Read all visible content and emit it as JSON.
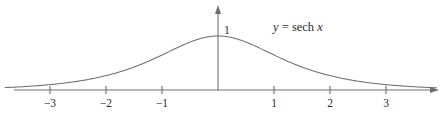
{
  "figure": {
    "background_color": "#ffffff",
    "line_color": "#6e6e6e",
    "text_color": "#2b2b2b"
  },
  "equation": {
    "lhs": "y",
    "operator": "=",
    "function_name": "sech",
    "argument": "x",
    "full_text": "y = sech x"
  },
  "axes": {
    "y_axis_max_label": "1",
    "x_tick_labels": [
      "−3",
      "−2",
      "−1",
      "1",
      "2",
      "3"
    ],
    "x_tick_values": [
      -3,
      -2,
      -1,
      1,
      2,
      3
    ]
  },
  "chart_data": {
    "type": "line",
    "title": "",
    "subtitle": "",
    "xlabel": "x",
    "ylabel": "y",
    "xlim": [
      -3.8,
      3.9
    ],
    "ylim": [
      0,
      1.15
    ],
    "grid": false,
    "legend_position": "none",
    "annotations": [
      {
        "text": "y = sech x",
        "x": 1.3,
        "y": 1.0
      },
      {
        "text": "1",
        "x": 0.1,
        "y": 1.0
      }
    ],
    "series": [
      {
        "name": "y = sech x",
        "color": "#6e6e6e",
        "x": [
          -3.8,
          -3.6,
          -3.4,
          -3.2,
          -3.0,
          -2.8,
          -2.6,
          -2.4,
          -2.2,
          -2.0,
          -1.8,
          -1.6,
          -1.4,
          -1.2,
          -1.0,
          -0.8,
          -0.6,
          -0.4,
          -0.2,
          0.0,
          0.2,
          0.4,
          0.6,
          0.8,
          1.0,
          1.2,
          1.4,
          1.6,
          1.8,
          2.0,
          2.2,
          2.4,
          2.6,
          2.8,
          3.0,
          3.2,
          3.4,
          3.6,
          3.8
        ],
        "y": [
          0.0446,
          0.0545,
          0.0666,
          0.0813,
          0.0993,
          0.1212,
          0.1479,
          0.1803,
          0.2194,
          0.2658,
          0.3199,
          0.3811,
          0.448,
          0.518,
          0.6481,
          0.7477,
          0.8436,
          0.925,
          0.9803,
          1.0,
          0.9803,
          0.925,
          0.8436,
          0.7477,
          0.6481,
          0.518,
          0.448,
          0.3811,
          0.3199,
          0.2658,
          0.2194,
          0.1803,
          0.1479,
          0.1212,
          0.0993,
          0.0813,
          0.0666,
          0.0545,
          0.0446
        ]
      }
    ]
  }
}
